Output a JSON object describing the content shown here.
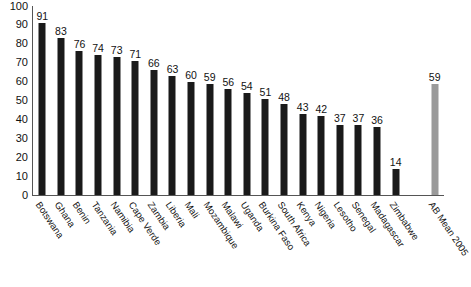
{
  "chart_data": {
    "type": "bar",
    "title": "",
    "subtitle": "",
    "xlabel": "",
    "ylabel": "",
    "ylim": [
      0,
      100
    ],
    "ytick_step": 10,
    "yticks": [
      100,
      90,
      80,
      70,
      60,
      50,
      40,
      30,
      20,
      10,
      0
    ],
    "grid": false,
    "legend": "none",
    "orientation": "vertical",
    "value_labels": true,
    "bar_color": "#1a1a1a",
    "highlight_color": "#9a9a9a",
    "categories": [
      "Botswana",
      "Ghana",
      "Benin",
      "Tanzania",
      "Namibia",
      "Cape Verde",
      "Zambia",
      "Liberia",
      "Mali",
      "Mozambique",
      "Malawi",
      "Uganda",
      "Burkina Faso",
      "South Africa",
      "Kenya",
      "Nigeria",
      "Lesotho",
      "Senegal",
      "Madagascar",
      "Zimbabwe",
      "AB Mean 2005"
    ],
    "values": [
      91,
      83,
      76,
      74,
      73,
      71,
      66,
      63,
      60,
      59,
      56,
      54,
      51,
      48,
      43,
      42,
      37,
      37,
      36,
      14,
      59
    ],
    "highlight_index": 20
  }
}
